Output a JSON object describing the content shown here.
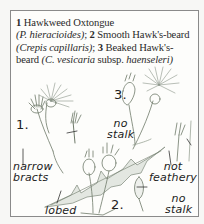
{
  "caption": {
    "entries": [
      {
        "number": "1",
        "common": "Hawkweed Oxtongue",
        "latin": "(P. hieracioides)",
        "sep": ";"
      },
      {
        "number": "2",
        "common": "Smooth Hawk's-beard",
        "latin": "(Crepis capillaris)",
        "sep": ";"
      },
      {
        "number": "3",
        "common": "Beaked Hawk's-beard",
        "latin": "(C. vesicaria",
        "latin_suffix": "subsp.",
        "latin_end": "haenseleri)"
      }
    ]
  },
  "figure_labels": {
    "plant_1": "1.",
    "plant_2": "2.",
    "plant_3": "3.",
    "no_stalk_top": [
      "no",
      "stalk"
    ],
    "narrow_bracts": [
      "narrow",
      "bracts"
    ],
    "lobed": "lobed",
    "not_feathery": [
      "not",
      "feathery"
    ],
    "no_stalk_bottom": [
      "no",
      "stalk"
    ]
  },
  "colors": {
    "frame": "#8a8a8a",
    "ink": "#222222",
    "sketch": "#6f7a6a",
    "leaf": "#9aa597",
    "background": "#fdfdfb"
  }
}
